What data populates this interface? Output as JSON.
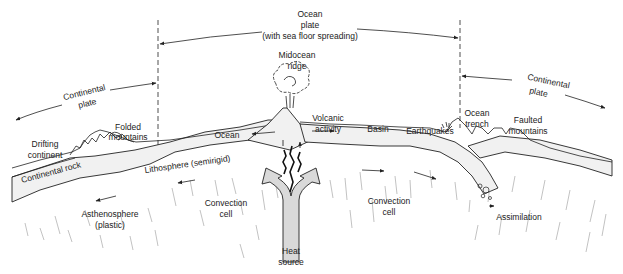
{
  "diagram": {
    "type": "plate-tectonics-cross-section",
    "colors": {
      "ink": "#222222",
      "background": "#ffffff",
      "heat_arrow": "#d9d9d9",
      "lithosphere": "#f1f1f1"
    },
    "plate_labels": {
      "ocean_plate": [
        "Ocean",
        "plate",
        "(with sea floor spreading)"
      ],
      "continental_plate_left": [
        "Continental",
        "plate"
      ],
      "continental_plate_right": [
        "Continental",
        "plate"
      ]
    },
    "features": {
      "midocean_ridge": [
        "Midocean",
        "ridge"
      ],
      "volcanic_activity": [
        "Volcanic",
        "activity"
      ],
      "drifting_continent": [
        "Drifting",
        "continent"
      ],
      "folded_mountains": [
        "Folded",
        "mountains"
      ],
      "ocean": "Ocean",
      "basin": "Basin",
      "earthquakes": "Earthquakes",
      "ocean_trench": [
        "Ocean",
        "trench"
      ],
      "faulted_mountains": [
        "Faulted",
        "mountains"
      ],
      "continental_rock": "Continental rock",
      "lithosphere": "Lithosphere (semirigid)",
      "asthenosphere": [
        "Asthenosphere",
        "(plastic)"
      ],
      "convection_cell_left": [
        "Convection",
        "cell"
      ],
      "convection_cell_right": [
        "Convection",
        "cell"
      ],
      "heat_source": [
        "Heat",
        "source"
      ],
      "assimilation": "Assimilation"
    }
  }
}
